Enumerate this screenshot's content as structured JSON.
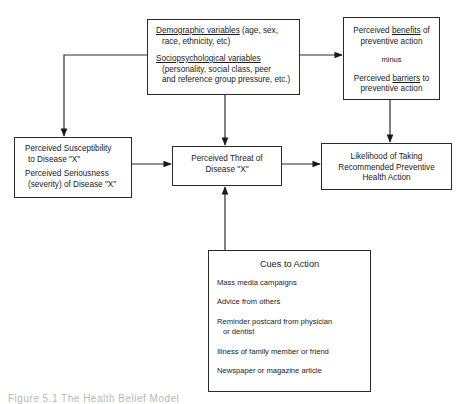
{
  "diagram": {
    "demographic": {
      "demo_label": "Demographic variables",
      "demo_detail_1": " (age, sex,",
      "demo_detail_2": "race, ethnicity, etc)",
      "socio_label": "Sociopsychological variables",
      "socio_detail_1": "(personality, social class, peer",
      "socio_detail_2": "and reference group pressure, etc.)"
    },
    "benefits": {
      "line1_pre": "Perceived ",
      "line1_u": "benefits",
      "line1_post": " of",
      "line2": "preventive action",
      "minus": "minus",
      "line3_pre": "Perceived ",
      "line3_u": "barriers",
      "line3_post": " to",
      "line4": "preventive action"
    },
    "susceptibility": {
      "line1": "Perceived Susceptibility",
      "line2": "to Disease \"X\"",
      "line3": "Perceived Seriousness",
      "line4": "(severity) of Disease \"X\""
    },
    "threat": {
      "line1": "Perceived Threat of",
      "line2": "Disease \"X\""
    },
    "likelihood": {
      "line1": "Likelihood of Taking",
      "line2": "Recommended Preventive",
      "line3": "Health Action"
    },
    "cues": {
      "title": "Cues to Action",
      "items": [
        "Mass media campaigns",
        "Advice from others",
        "Reminder postcard from  physician",
        "or dentist",
        "Illness of family member or friend",
        "Newspaper or magazine article"
      ]
    },
    "caption": "Figure 5.1  The Health Belief Model"
  },
  "colors": {
    "line": "#2a2a2a",
    "background": "#ffffff"
  }
}
